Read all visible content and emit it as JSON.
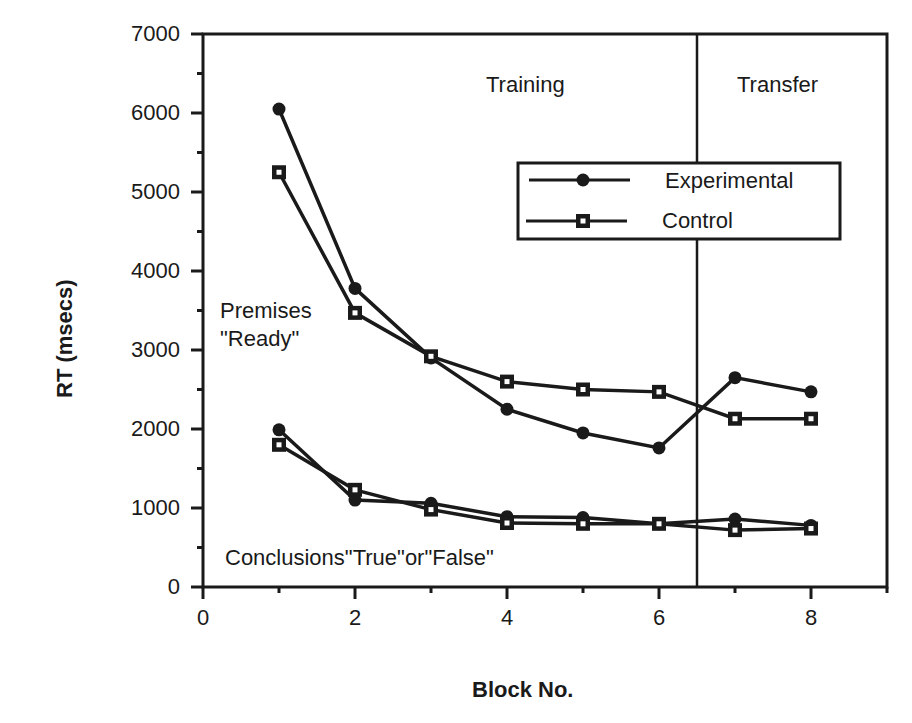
{
  "chart_data": {
    "type": "line",
    "title": "",
    "xlabel": "Block No.",
    "ylabel": "RT   (msecs)",
    "xlim": [
      0,
      9
    ],
    "ylim": [
      0,
      7000
    ],
    "x_ticks": [
      "0",
      "2",
      "4",
      "6",
      "8"
    ],
    "y_ticks": [
      "0",
      "1000",
      "2000",
      "3000",
      "4000",
      "5000",
      "6000",
      "7000"
    ],
    "grid": false,
    "legend_position": "upper right (inside plot)",
    "x": [
      1,
      2,
      3,
      4,
      5,
      6,
      7,
      8
    ],
    "phase_divider_x": 6.5,
    "phases": [
      "Training",
      "Transfer"
    ],
    "series": [
      {
        "name": "Experimental",
        "group": "Premises \"Ready\"",
        "marker": "filled-circle",
        "values": [
          6050,
          3780,
          2900,
          2250,
          1950,
          1760,
          2650,
          2470
        ]
      },
      {
        "name": "Control",
        "group": "Premises \"Ready\"",
        "marker": "open-square",
        "values": [
          5250,
          3470,
          2920,
          2600,
          2500,
          2470,
          2130,
          2130
        ]
      },
      {
        "name": "Experimental",
        "group": "Conclusions \"True\" or \"False\"",
        "marker": "filled-circle",
        "values": [
          1990,
          1100,
          1060,
          890,
          880,
          800,
          860,
          780
        ]
      },
      {
        "name": "Control",
        "group": "Conclusions \"True\" or \"False\"",
        "marker": "open-square",
        "values": [
          1800,
          1230,
          980,
          810,
          800,
          800,
          720,
          740
        ]
      }
    ],
    "annotations": [
      "Training",
      "Transfer",
      "Premises",
      "\"Ready\"",
      "Conclusions\"True\"or\"False\""
    ]
  },
  "labels": {
    "training": "Training",
    "transfer": "Transfer",
    "premises_1": "Premises",
    "premises_2": "\"Ready\"",
    "conclusions": "Conclusions\"True\"or\"False\"",
    "legend_exp": "Experimental",
    "legend_ctrl": "Control",
    "xlabel": "Block No.",
    "ylabel": "RT   (msecs)"
  }
}
